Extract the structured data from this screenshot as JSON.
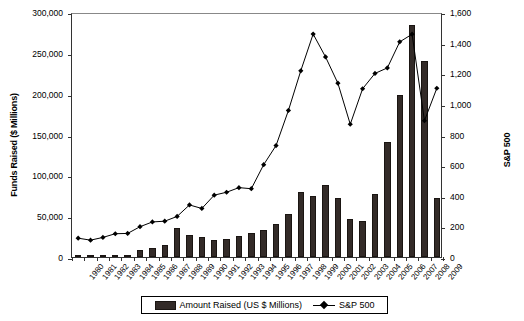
{
  "chart_data": {
    "type": "bar",
    "title": "",
    "xlabel": "",
    "ylabel": "Funds Raised ($ Millions)",
    "y2label": "S&P 500",
    "grid": false,
    "legend_position": "bottom",
    "ylim": [
      0,
      300000
    ],
    "y2lim": [
      0,
      1600
    ],
    "yticks": [
      "0",
      "50,000",
      "100,000",
      "150,000",
      "200,000",
      "250,000",
      "300,000"
    ],
    "ytick_values": [
      0,
      50000,
      100000,
      150000,
      200000,
      250000,
      300000
    ],
    "y2ticks": [
      "0",
      "200",
      "400",
      "600",
      "800",
      "1,000",
      "1,200",
      "1,400",
      "1,600"
    ],
    "y2tick_values": [
      0,
      200,
      400,
      600,
      800,
      1000,
      1200,
      1400,
      1600
    ],
    "categories": [
      "1980",
      "1981",
      "1982",
      "1983",
      "1984",
      "1985",
      "1986",
      "1987",
      "1988",
      "1989",
      "1990",
      "1991",
      "1992",
      "1993",
      "1994",
      "1995",
      "1996",
      "1997",
      "1998",
      "1999",
      "2000",
      "2001",
      "2002",
      "2003",
      "2004",
      "2005",
      "2006",
      "2007",
      "2008",
      "2009"
    ],
    "series": [
      {
        "name": "Amount Raised (US $ Millions)",
        "type": "bar",
        "axis": "left",
        "color": "#332b28",
        "values": [
          1200,
          1500,
          1800,
          2500,
          3000,
          8500,
          11000,
          15000,
          35000,
          27000,
          24000,
          21000,
          22000,
          26000,
          30000,
          33000,
          40000,
          53000,
          79000,
          75000,
          88000,
          72000,
          46000,
          44000,
          77000,
          141000,
          198000,
          284000,
          240000,
          72000
        ]
      },
      {
        "name": "S&P 500",
        "type": "line",
        "axis": "right",
        "color": "#000000",
        "marker": "diamond",
        "values": [
          136,
          123,
          141,
          165,
          167,
          211,
          242,
          247,
          278,
          353,
          330,
          417,
          436,
          466,
          459,
          616,
          741,
          970,
          1229,
          1469,
          1320,
          1148,
          880,
          1112,
          1212,
          1248,
          1418,
          1468,
          903,
          1115
        ]
      }
    ]
  },
  "legend": {
    "bar_label": "Amount Raised (US $ Millions)",
    "line_label": "S&P 500"
  }
}
